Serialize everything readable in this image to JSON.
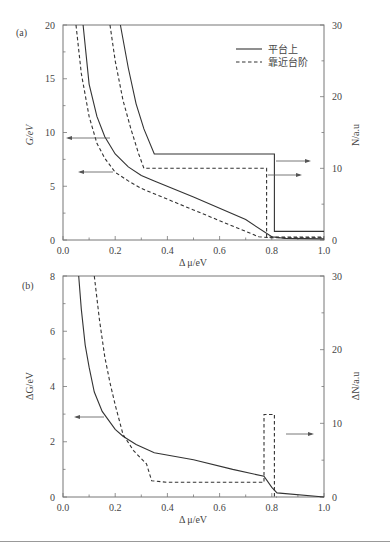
{
  "chart_data": [
    {
      "panel": "(a)",
      "type": "line",
      "xlabel": "Δ μ/eV",
      "ylabel_left": "G/eV",
      "ylabel_right": "N/a.u",
      "xlim": [
        0.0,
        1.0
      ],
      "ylim_left": [
        0,
        20
      ],
      "ylim_right": [
        0,
        30
      ],
      "x_ticks": [
        "0.0",
        "0.2",
        "0.4",
        "0.6",
        "0.8",
        "1.0"
      ],
      "y_ticks_left": [
        "0",
        "5",
        "10",
        "15",
        "20"
      ],
      "y_ticks_right": [
        "0",
        "10",
        "20",
        "30"
      ],
      "grid": false,
      "legend": {
        "position": "upper right",
        "entries": [
          {
            "label": "平台上",
            "style": "solid"
          },
          {
            "label": "靠近台阶",
            "style": "dashed"
          }
        ]
      },
      "series": [
        {
          "name": "平台上 G",
          "axis": "left",
          "style": "solid",
          "x": [
            0.077,
            0.1,
            0.13,
            0.16,
            0.2,
            0.25,
            0.3,
            0.35,
            0.5,
            0.7,
            0.8,
            0.85,
            1.0
          ],
          "y": [
            20,
            14.5,
            11.5,
            9.6,
            8.0,
            6.8,
            6.0,
            5.5,
            4.0,
            1.9,
            0.3,
            0.15,
            0.1
          ]
        },
        {
          "name": "靠近台阶 G",
          "axis": "left",
          "style": "dashed",
          "x": [
            0.05,
            0.07,
            0.1,
            0.13,
            0.16,
            0.2,
            0.25,
            0.3,
            0.4,
            0.5,
            0.6,
            0.7,
            0.75,
            0.8,
            1.0
          ],
          "y": [
            20,
            15.5,
            11.5,
            9.0,
            7.6,
            6.3,
            5.5,
            4.8,
            3.8,
            2.8,
            1.8,
            0.8,
            0.3,
            0.2,
            0.2
          ]
        },
        {
          "name": "平台上 N",
          "axis": "right",
          "style": "solid",
          "x": [
            0.22,
            0.25,
            0.28,
            0.31,
            0.35,
            0.81,
            0.81,
            1.0
          ],
          "y": [
            30,
            24,
            19,
            15.5,
            12,
            12,
            1.2,
            1.2
          ]
        },
        {
          "name": "靠近台阶 N",
          "axis": "right",
          "style": "dashed",
          "x": [
            0.18,
            0.2,
            0.23,
            0.26,
            0.29,
            0.31,
            0.78,
            0.78,
            1.0
          ],
          "y": [
            30,
            25,
            19.5,
            15.5,
            12,
            10,
            10,
            0.4,
            0.4
          ]
        }
      ],
      "annotations": [
        {
          "type": "arrow",
          "direction": "left",
          "target_axis": "G",
          "note": "points to left axis"
        },
        {
          "type": "arrow",
          "direction": "left",
          "target_axis": "G",
          "note": "points to left axis"
        },
        {
          "type": "arrow",
          "direction": "right",
          "target_axis": "N",
          "note": "points to right axis"
        },
        {
          "type": "arrow",
          "direction": "right",
          "target_axis": "N",
          "note": "points to right axis"
        }
      ]
    },
    {
      "panel": "(b)",
      "type": "line",
      "xlabel": "Δ μ/eV",
      "ylabel_left": "ΔG/eV",
      "ylabel_right": "ΔN/a.u",
      "xlim": [
        0.0,
        1.0
      ],
      "ylim_left": [
        0,
        8
      ],
      "ylim_right": [
        0,
        30
      ],
      "x_ticks": [
        "0.0",
        "0.2",
        "0.4",
        "0.6",
        "0.8",
        "1.0"
      ],
      "y_ticks_left": [
        "0",
        "2",
        "4",
        "6",
        "8"
      ],
      "y_ticks_right": [
        "0",
        "10",
        "20",
        "30"
      ],
      "grid": false,
      "series": [
        {
          "name": "ΔG",
          "axis": "left",
          "style": "solid",
          "x": [
            0.06,
            0.07,
            0.085,
            0.1,
            0.12,
            0.15,
            0.2,
            0.23,
            0.28,
            0.35,
            0.5,
            0.65,
            0.77,
            0.8,
            0.82,
            1.0
          ],
          "y": [
            8,
            6.8,
            5.5,
            4.7,
            3.8,
            3.1,
            2.45,
            2.2,
            1.9,
            1.6,
            1.35,
            1.0,
            0.75,
            0.35,
            0.15,
            0.0
          ]
        },
        {
          "name": "ΔN",
          "axis": "right",
          "style": "dashed",
          "x": [
            0.12,
            0.14,
            0.16,
            0.18,
            0.2,
            0.23,
            0.27,
            0.32,
            0.34,
            0.4,
            0.6,
            0.77,
            0.77,
            0.81,
            0.81,
            0.82
          ],
          "y": [
            30,
            24,
            19,
            15.5,
            12.5,
            8.5,
            6.3,
            4.5,
            2.2,
            2.0,
            2.0,
            2.0,
            11.2,
            11.2,
            0.0,
            0.0
          ]
        }
      ],
      "annotations": [
        {
          "type": "arrow",
          "direction": "left",
          "target_axis": "ΔG",
          "note": "points to left axis"
        },
        {
          "type": "arrow",
          "direction": "right",
          "target_axis": "ΔN",
          "note": "points to right axis"
        }
      ]
    }
  ],
  "panels": {
    "a": {
      "label": "(a)",
      "xlabel": "Δ μ/eV",
      "ylabel_left": "G/eV",
      "ylabel_right": "N/a.u",
      "x_ticks": [
        "0.0",
        "0.2",
        "0.4",
        "0.6",
        "0.8",
        "1.0"
      ],
      "y_ticks_left": [
        "0",
        "5",
        "10",
        "15",
        "20"
      ],
      "y_ticks_right": [
        "0",
        "10",
        "20",
        "30"
      ],
      "legend": [
        "平台上",
        "靠近台阶"
      ]
    },
    "b": {
      "label": "(b)",
      "xlabel": "Δ μ/eV",
      "ylabel_left": "ΔG/eV",
      "ylabel_right": "ΔN/a.u",
      "x_ticks": [
        "0.0",
        "0.2",
        "0.4",
        "0.6",
        "0.8",
        "1.0"
      ],
      "y_ticks_left": [
        "0",
        "2",
        "4",
        "6",
        "8"
      ],
      "y_ticks_right": [
        "0",
        "10",
        "20",
        "30"
      ]
    }
  },
  "colors": {
    "line": "#333333",
    "axis": "#777777",
    "text": "#444444",
    "background": "#ffffff"
  }
}
